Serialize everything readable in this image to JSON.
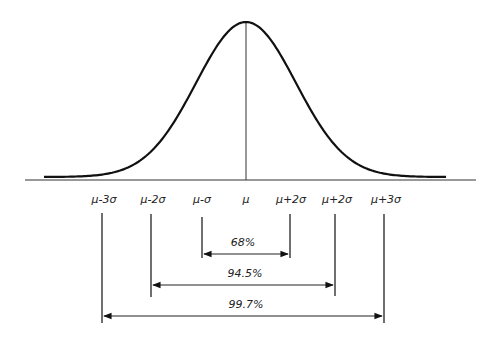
{
  "diagram": {
    "title": "",
    "colors": {
      "stroke": "#111111",
      "text": "#222222",
      "background": "#ffffff"
    },
    "axis_labels": [
      "μ-3σ",
      "μ-2σ",
      "μ-σ",
      "μ",
      "μ+2σ",
      "μ+2σ",
      "μ+3σ"
    ],
    "ranges": [
      {
        "label": "68%"
      },
      {
        "label": "94.5%"
      },
      {
        "label": "99.7%"
      }
    ]
  },
  "chart_data": {
    "type": "line",
    "xlabel": "",
    "ylabel": "",
    "x_tick_labels": [
      "μ-3σ",
      "μ-2σ",
      "μ-σ",
      "μ",
      "μ+2σ",
      "μ+2σ",
      "μ+3σ"
    ],
    "annotations": [
      {
        "from": "μ-σ",
        "to": "μ+σ",
        "text": "68%"
      },
      {
        "from": "μ-2σ",
        "to": "μ+2σ",
        "text": "94.5%"
      },
      {
        "from": "μ-3σ",
        "to": "μ+3σ",
        "text": "99.7%"
      }
    ],
    "grid": false
  }
}
